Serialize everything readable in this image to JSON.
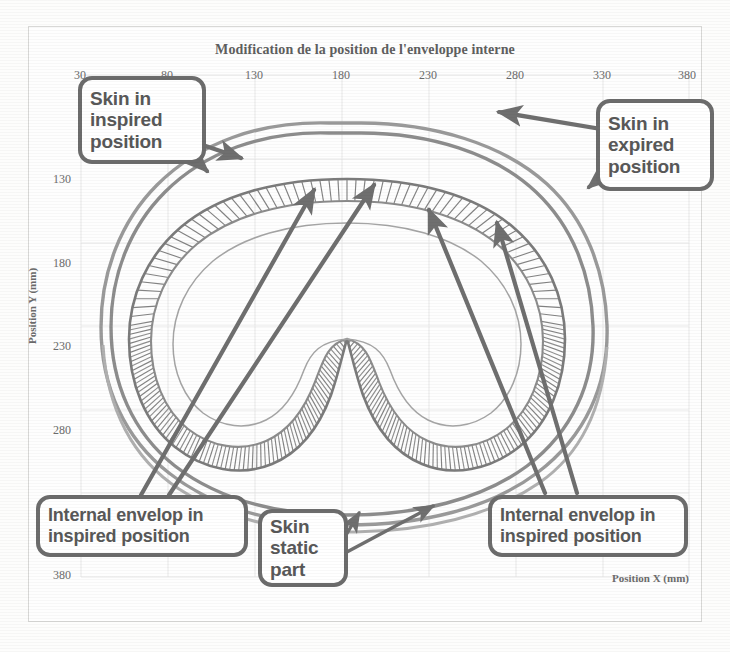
{
  "chart_data": {
    "type": "line",
    "title": "Modification de la position de l'enveloppe interne",
    "xlabel": "Position X (mm)",
    "ylabel": "Position Y (mm)",
    "xlim": [
      30,
      380
    ],
    "ylim": [
      80,
      380
    ],
    "xticks": [
      30,
      80,
      130,
      180,
      230,
      280,
      330,
      380
    ],
    "xtick_labels": [
      "30",
      "80",
      "130",
      "180",
      "230",
      "280",
      "330",
      "380"
    ],
    "yticks": [
      130,
      180,
      230,
      280,
      330,
      380
    ],
    "ytick_labels": [
      "130",
      "180",
      "230",
      "280",
      "330",
      "380"
    ],
    "grid": true,
    "legend": "none",
    "series": [
      {
        "name": "Skin in inspired position",
        "style": "closed-outer-contour",
        "color": "#8a8a8a"
      },
      {
        "name": "Skin in expired position",
        "style": "closed-outer-contour",
        "color": "#9a9a9a"
      },
      {
        "name": "Skin static part",
        "style": "lower-open-contour",
        "color": "#a8a8a8"
      },
      {
        "name": "Internal envelop in inspired position",
        "style": "kidney-contour-with-radial-hatch",
        "color": "#7b7b7b"
      }
    ],
    "annotations": [
      {
        "label": "Skin in inspired position",
        "position": "top-left"
      },
      {
        "label": "Skin in expired position",
        "position": "top-right"
      },
      {
        "label": "Internal envelop in inspired position",
        "position": "bottom-left"
      },
      {
        "label": "Skin static part",
        "position": "bottom-center"
      },
      {
        "label": "Internal envelop in inspired position",
        "position": "bottom-right"
      }
    ]
  },
  "chart": {
    "title": "Modification de la position de l'enveloppe interne",
    "xlabel": "Position X (mm)",
    "ylabel": "Position Y (mm)",
    "xticks": [
      "30",
      "80",
      "130",
      "180",
      "230",
      "280",
      "330",
      "380"
    ],
    "yticks": [
      "130",
      "180",
      "230",
      "280",
      "330",
      "380"
    ]
  },
  "callouts": {
    "skin_inspired": "Skin in inspired position",
    "skin_expired": "Skin in expired position",
    "internal_left": "Internal envelop in inspired position",
    "skin_static": "Skin static part",
    "internal_right": "Internal envelop in inspired position"
  },
  "colors": {
    "callout_border": "#6c6c6c",
    "callout_text": "#585858",
    "axis_text": "#6b6b6b",
    "grid": "#e6e6e6",
    "curve_dark": "#7b7b7b",
    "curve_light": "#a8a8a8",
    "arrow": "#6f6f6f"
  }
}
